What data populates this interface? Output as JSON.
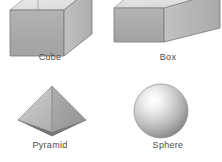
{
  "figure": {
    "background_color": "#ffffff",
    "width": 222,
    "height": 162,
    "label_color": "#4a4a4a"
  },
  "shapes": [
    {
      "name": "cube",
      "label": "Cube",
      "icon": "cube-icon",
      "description": "Three dimensional cube drawn in oblique perspective, top face cropped by image edge",
      "faces": {
        "top": "#e8e8e8",
        "front": "#a8a8a8",
        "side": "#b8b8b8"
      },
      "edge_color": "#707070"
    },
    {
      "name": "box",
      "label": "Box",
      "icon": "box-icon",
      "description": "Wide rectangular prism drawn in oblique perspective, top face cropped by image edge",
      "faces": {
        "top": "#e8e8e8",
        "front": "#a8a8a8",
        "side": "#b4b4b4"
      },
      "edge_color": "#707070"
    },
    {
      "name": "pyramid",
      "label": "Pyramid",
      "icon": "pyramid-icon",
      "description": "Square based pyramid with two visible triangular faces and a dark base",
      "faces": {
        "left": "#bdbdbd",
        "right": "#a0a0a0",
        "base": "#6e6e6e"
      },
      "edge_color": "#8a8a8a"
    },
    {
      "name": "sphere",
      "label": "Sphere",
      "icon": "sphere-icon",
      "description": "Shaded sphere with specular highlight in the upper left",
      "gradient": {
        "highlight": "#ffffff",
        "mid": "#c0c0c0",
        "shadow": "#7a7a7a"
      },
      "edge_color": "#8c8c8c"
    }
  ]
}
